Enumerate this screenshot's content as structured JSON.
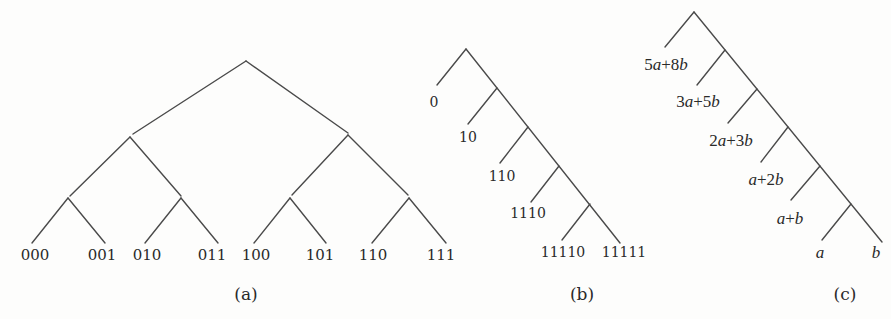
{
  "figure": {
    "panels": [
      {
        "id": "a",
        "caption": "(a)",
        "type": "complete-binary-tree",
        "leaves": [
          "000",
          "001",
          "010",
          "011",
          "100",
          "101",
          "110",
          "111"
        ]
      },
      {
        "id": "b",
        "caption": "(b)",
        "type": "right-skewed-binary-tree",
        "leaves": [
          "0",
          "10",
          "110",
          "1110",
          "11110",
          "11111"
        ]
      },
      {
        "id": "c",
        "caption": "(c)",
        "type": "right-skewed-weighted-tree",
        "leaves": [
          "5a+8b",
          "3a+5b",
          "2a+3b",
          "a+2b",
          "a+b",
          "a",
          "b"
        ]
      }
    ]
  },
  "labels": {
    "a": {
      "caption": "(a)",
      "l0": "000",
      "l1": "001",
      "l2": "010",
      "l3": "011",
      "l4": "100",
      "l5": "101",
      "l6": "110",
      "l7": "111"
    },
    "b": {
      "caption": "(b)",
      "l0": "0",
      "l1": "10",
      "l2": "110",
      "l3": "1110",
      "l4": "11110",
      "l5": "11111"
    },
    "c": {
      "caption": "(c)",
      "l0_num1": "5",
      "l0_var1": "a",
      "l0_op": "+",
      "l0_num2": "8",
      "l0_var2": "b",
      "l1_num1": "3",
      "l1_var1": "a",
      "l1_op": "+",
      "l1_num2": "5",
      "l1_var2": "b",
      "l2_num1": "2",
      "l2_var1": "a",
      "l2_op": "+",
      "l2_num2": "3",
      "l2_var2": "b",
      "l3_var1": "a",
      "l3_op": "+",
      "l3_num2": "2",
      "l3_var2": "b",
      "l4_var1": "a",
      "l4_op": "+",
      "l4_var2": "b",
      "l5": "a",
      "l6": "b"
    }
  }
}
